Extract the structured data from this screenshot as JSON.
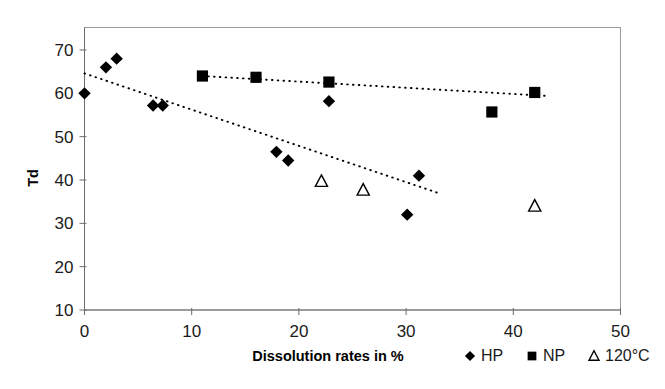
{
  "chart_data": {
    "type": "scatter",
    "title": "",
    "xlabel": "Dissolution rates in %",
    "ylabel": "Td",
    "xlim": [
      0,
      50
    ],
    "ylim": [
      10,
      70
    ],
    "xticks": [
      0,
      10,
      20,
      30,
      40,
      50
    ],
    "yticks": [
      10,
      20,
      30,
      40,
      50,
      60,
      70
    ],
    "grid": false,
    "legend_position": "bottom-right",
    "series": [
      {
        "name": "HP",
        "marker": "filled-diamond",
        "color": "#000000",
        "trendline": "dotted",
        "points": [
          {
            "x": 0.0,
            "y": 60.0
          },
          {
            "x": 2.0,
            "y": 66.0
          },
          {
            "x": 3.0,
            "y": 68.0
          },
          {
            "x": 6.4,
            "y": 57.2
          },
          {
            "x": 7.3,
            "y": 57.2
          },
          {
            "x": 17.9,
            "y": 46.5
          },
          {
            "x": 19.0,
            "y": 44.5
          },
          {
            "x": 22.8,
            "y": 58.2
          },
          {
            "x": 30.1,
            "y": 32.0
          },
          {
            "x": 31.2,
            "y": 41.0
          }
        ]
      },
      {
        "name": "NP",
        "marker": "filled-square",
        "color": "#000000",
        "trendline": "dotted",
        "points": [
          {
            "x": 11.0,
            "y": 64.0
          },
          {
            "x": 16.0,
            "y": 63.7
          },
          {
            "x": 22.8,
            "y": 62.6
          },
          {
            "x": 38.0,
            "y": 55.7
          },
          {
            "x": 42.0,
            "y": 60.2
          }
        ]
      },
      {
        "name": "120°C",
        "marker": "open-triangle",
        "color": "#000000",
        "trendline": "none",
        "points": [
          {
            "x": 22.1,
            "y": 39.7
          },
          {
            "x": 26.0,
            "y": 37.7
          },
          {
            "x": 42.0,
            "y": 34.0
          }
        ]
      }
    ],
    "trendlines": [
      {
        "series": "HP",
        "x1": 0.0,
        "y1": 64.6,
        "x2": 33.0,
        "y2": 37.0
      },
      {
        "series": "NP",
        "x1": 11.0,
        "y1": 64.0,
        "x2": 43.2,
        "y2": 59.4
      }
    ]
  },
  "axes": {
    "x_tick_labels": [
      "0",
      "10",
      "20",
      "30",
      "40",
      "50"
    ],
    "y_tick_labels": [
      "10",
      "20",
      "30",
      "40",
      "50",
      "60",
      "70"
    ],
    "x_axis_title": "Dissolution rates in %",
    "y_axis_title": "Td"
  },
  "legend": {
    "items": [
      {
        "label": "HP",
        "marker": "filled-diamond"
      },
      {
        "label": "NP",
        "marker": "filled-square"
      },
      {
        "label": "120°C",
        "marker": "open-triangle"
      }
    ]
  },
  "colors": {
    "marker": "#000000",
    "axis": "#6b6b6b",
    "border": "#9a9a9a",
    "background": "#ffffff"
  }
}
